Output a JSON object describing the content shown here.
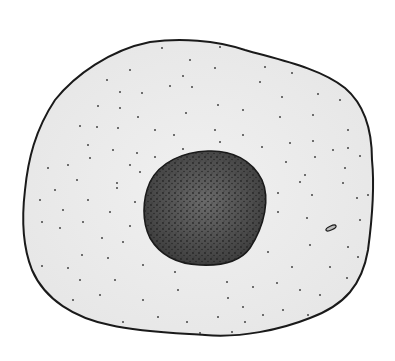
{
  "diagram": {
    "parts": [
      {
        "name": "cell-membrane",
        "fill": "#ececec",
        "stroke": "#1a1a1a"
      },
      {
        "name": "nucleus",
        "fill": "#4a4a4a",
        "stroke": "#1a1a1a"
      },
      {
        "name": "small-organelle",
        "fill": "#bbbbbb",
        "stroke": "#1a1a1a"
      }
    ],
    "labels": []
  }
}
